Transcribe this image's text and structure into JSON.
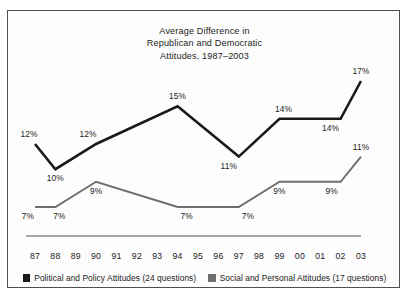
{
  "chart_data": {
    "type": "line",
    "title": "Average Difference in Republican and Democratic Attitudes, 1987–2003",
    "title_lines": [
      "Average Difference in",
      "Republican and Democratic",
      "Attitudes, 1987–2003"
    ],
    "xlabel": "",
    "ylabel": "",
    "grid": false,
    "legend_position": "bottom",
    "ylim": [
      0,
      20
    ],
    "axis_line": true,
    "categories": [
      "87",
      "88",
      "89",
      "90",
      "91",
      "92",
      "93",
      "94",
      "95",
      "96",
      "97",
      "98",
      "99",
      "00",
      "01",
      "02",
      "03"
    ],
    "series": [
      {
        "name": "Political and Policy Attitudes (24 questions)",
        "color": "#1a1a1a",
        "short_name": "Political and Policy Attitudes",
        "question_count": "24 questions",
        "values": [
          12,
          10,
          null,
          12,
          null,
          null,
          null,
          15,
          null,
          null,
          11,
          null,
          14,
          null,
          null,
          14,
          17
        ],
        "labels": [
          "12%",
          "10%",
          null,
          "12%",
          null,
          null,
          null,
          "15%",
          null,
          null,
          "11%",
          null,
          "14%",
          null,
          null,
          "14%",
          "17%"
        ],
        "label_positions": [
          "above",
          "below",
          null,
          "above",
          null,
          null,
          null,
          "above",
          null,
          null,
          "below",
          null,
          "above",
          null,
          null,
          "below",
          "above"
        ]
      },
      {
        "name": "Social and Personal Attitudes (17 questions)",
        "color": "#6e6e6e",
        "short_name": "Social and Personal Attitudes",
        "question_count": "17 questions",
        "values": [
          7,
          7,
          null,
          9,
          null,
          null,
          null,
          7,
          null,
          null,
          7,
          null,
          9,
          null,
          null,
          9,
          11
        ],
        "labels": [
          "7%",
          "7%",
          null,
          "9%",
          null,
          null,
          null,
          "7%",
          null,
          null,
          "7%",
          null,
          "9%",
          null,
          null,
          "9%",
          "11%"
        ],
        "label_positions": [
          "below",
          "below",
          null,
          "below",
          null,
          null,
          null,
          "below",
          null,
          null,
          "below",
          null,
          "below",
          null,
          null,
          "below",
          "above"
        ]
      }
    ]
  },
  "legend": {
    "entries": [
      {
        "label": "Political and Policy Attitudes (24 questions)",
        "color": "#1a1a1a"
      },
      {
        "label": "Social and Personal Attitudes (17 questions)",
        "color": "#6e6e6e"
      }
    ]
  },
  "colors": {
    "frame": "#4f4f4f",
    "background": "#fdfdfd",
    "text": "#1b1b1b",
    "series_political": "#1a1a1a",
    "series_social": "#6e6e6e",
    "axis": "#7a7a7a"
  }
}
